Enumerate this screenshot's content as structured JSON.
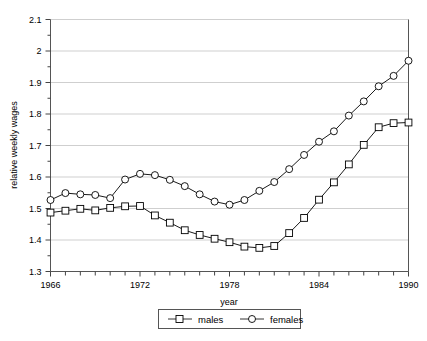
{
  "chart_data": {
    "type": "line",
    "title": "",
    "xlabel": "year",
    "ylabel": "relative weekly wages",
    "xlim": [
      1966,
      1990
    ],
    "ylim": [
      1.3,
      2.1
    ],
    "grid": true,
    "grid_axis": "y",
    "legend_position": "bottom-center",
    "x": [
      1966,
      1967,
      1968,
      1969,
      1970,
      1971,
      1972,
      1973,
      1974,
      1975,
      1976,
      1977,
      1978,
      1979,
      1980,
      1981,
      1982,
      1983,
      1984,
      1985,
      1986,
      1987,
      1988,
      1989,
      1990
    ],
    "xticks": [
      1966,
      1972,
      1978,
      1984,
      1990
    ],
    "xtick_labels": [
      "1966",
      "1972",
      "1978",
      "1984",
      "1990"
    ],
    "yticks": [
      1.3,
      1.4,
      1.5,
      1.6,
      1.7,
      1.8,
      1.9,
      2.0,
      2.1
    ],
    "ytick_labels": [
      "1.3",
      "1.4",
      "1.5",
      "1.6",
      "1.7",
      "1.8",
      "1.9",
      "2",
      "2.1"
    ],
    "y_minor_ticks": [
      1.35,
      1.45,
      1.55,
      1.65,
      1.75,
      1.85,
      1.95,
      2.05
    ],
    "series": [
      {
        "name": "males",
        "marker": "square",
        "color": "#000000",
        "values": [
          1.487,
          1.493,
          1.499,
          1.494,
          1.502,
          1.507,
          1.508,
          1.478,
          1.455,
          1.431,
          1.416,
          1.404,
          1.393,
          1.379,
          1.375,
          1.381,
          1.422,
          1.47,
          1.528,
          1.583,
          1.64,
          1.702,
          1.758,
          1.771,
          1.773
        ],
        "values_plotted": [
          1.487,
          1.493,
          1.499,
          1.494,
          1.502,
          1.507,
          1.508,
          1.478,
          1.455,
          1.431,
          1.416,
          1.404,
          1.393,
          1.379,
          1.375,
          1.381,
          1.422,
          1.47,
          1.528,
          1.583,
          1.64,
          1.702,
          1.758,
          1.771,
          1.773
        ]
      },
      {
        "name": "females",
        "marker": "circle",
        "color": "#000000",
        "values": [
          1.527,
          1.549,
          1.545,
          1.543,
          1.533,
          1.592,
          1.61,
          1.606,
          1.591,
          1.571,
          1.545,
          1.522,
          1.512,
          1.527,
          1.556,
          1.584,
          1.625,
          1.67,
          1.712,
          1.745,
          1.795,
          1.84,
          1.888,
          1.921,
          1.969
        ],
        "values_plotted": [
          1.527,
          1.549,
          1.545,
          1.543,
          1.533,
          1.592,
          1.61,
          1.606,
          1.591,
          1.571,
          1.545,
          1.522,
          1.512,
          1.527,
          1.556,
          1.584,
          1.625,
          1.67,
          1.712,
          1.745,
          1.795,
          1.84,
          1.888,
          1.921,
          1.969
        ]
      }
    ],
    "legend": [
      {
        "label": "males",
        "marker": "square"
      },
      {
        "label": "females",
        "marker": "circle"
      }
    ]
  },
  "series_actual": {
    "males": [
      1.487,
      1.493,
      1.499,
      1.494,
      1.502,
      1.507,
      1.508,
      1.478,
      1.455,
      1.431,
      1.416,
      1.404,
      1.393,
      1.379,
      1.375,
      1.381,
      1.422,
      1.47,
      1.528,
      1.583,
      1.64,
      1.702,
      1.758,
      1.771,
      1.773
    ],
    "females": [
      1.527,
      1.549,
      1.545,
      1.543,
      1.533,
      1.592,
      1.61,
      1.606,
      1.591,
      1.571,
      1.545,
      1.522,
      1.512,
      1.527,
      1.556,
      1.584,
      1.625,
      1.67,
      1.712,
      1.745,
      1.795,
      1.84,
      1.888,
      1.921,
      1.969
    ]
  },
  "axes": {
    "ylabel": "relative weekly wages",
    "xlabel": "year"
  },
  "legend": {
    "males_label": "males",
    "females_label": "females"
  }
}
